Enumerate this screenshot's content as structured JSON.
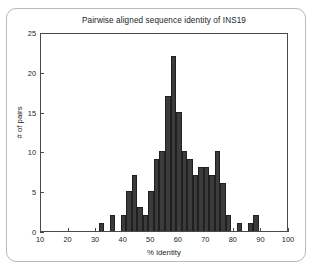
{
  "figure": {
    "title": "Pairwise aligned sequence identity of INS19",
    "bar_color": "#3b3b3b",
    "bar_edge_color": "#202020",
    "axis_color": "#4a4a4a",
    "background": "#ffffff"
  },
  "chart_data": {
    "type": "bar",
    "title": "Pairwise aligned sequence identity of INS19",
    "xlabel": "% identity",
    "ylabel": "# of pairs",
    "xlim": [
      10,
      100
    ],
    "ylim": [
      0,
      25
    ],
    "grid": false,
    "legend": null,
    "bin_width": 2,
    "xticks": [
      10,
      20,
      30,
      40,
      50,
      60,
      70,
      80,
      90,
      100
    ],
    "yticks": [
      0,
      5,
      10,
      15,
      20,
      25
    ],
    "xtick_labels": [
      "10",
      "20",
      "30",
      "40",
      "50",
      "60",
      "70",
      "80",
      "90",
      "100"
    ],
    "ytick_labels": [
      "0",
      "5",
      "10",
      "15",
      "20",
      "25"
    ],
    "categories": [
      "31-33",
      "33-35",
      "35-37",
      "37-39",
      "39-41",
      "41-43",
      "43-45",
      "45-47",
      "47-49",
      "49-51",
      "51-53",
      "53-55",
      "55-57",
      "57-59",
      "59-61",
      "61-63",
      "63-65",
      "65-67",
      "67-69",
      "69-71",
      "71-73",
      "73-75",
      "75-77",
      "77-79",
      "79-81",
      "81-83",
      "83-85",
      "85-87",
      "87-89"
    ],
    "bin_starts": [
      31,
      33,
      35,
      37,
      39,
      41,
      43,
      45,
      47,
      49,
      51,
      53,
      55,
      57,
      59,
      61,
      63,
      65,
      67,
      69,
      71,
      73,
      75,
      77,
      79,
      81,
      83,
      85,
      87
    ],
    "values": [
      1,
      0,
      2,
      0,
      2,
      5,
      7,
      3,
      2,
      5,
      9,
      10,
      17,
      22,
      15,
      10,
      9,
      7,
      8,
      8,
      7,
      10,
      6,
      2,
      0,
      1,
      0,
      1,
      2
    ]
  },
  "axes": {
    "y_label": "# of pairs",
    "x_label": "% identity"
  }
}
